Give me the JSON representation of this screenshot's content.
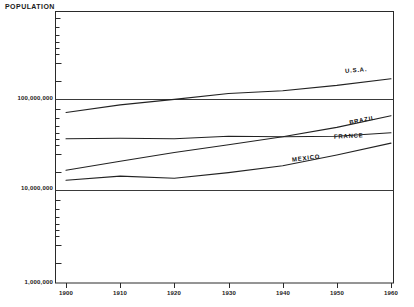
{
  "chart_data": {
    "type": "line",
    "title": "",
    "ylabel": "POPULATION",
    "xlabel": "",
    "yscale": "log",
    "ylim": [
      1000000,
      1000000000
    ],
    "xlim": [
      1900,
      1960
    ],
    "grid": "major-horizontal",
    "legend_position": "inline-right",
    "x_ticks": [
      "1900",
      "1910",
      "1920",
      "1930",
      "1940",
      "1950",
      "1960"
    ],
    "y_ticks": [
      "1,000,000",
      "10,000,000",
      "100,000,000"
    ],
    "x": [
      1900,
      1910,
      1920,
      1930,
      1940,
      1950,
      1960
    ],
    "series": [
      {
        "name": "U.S.A.",
        "values": [
          76000000,
          92000000,
          106000000,
          123000000,
          132000000,
          151000000,
          179000000
        ]
      },
      {
        "name": "BRAZIL",
        "values": [
          17500000,
          22000000,
          27500000,
          33500000,
          41000000,
          52000000,
          70000000
        ]
      },
      {
        "name": "FRANCE",
        "values": [
          39000000,
          39500000,
          39000000,
          41500000,
          41000000,
          41500000,
          45500000
        ]
      },
      {
        "name": "MEXICO",
        "values": [
          13600000,
          15100000,
          14300000,
          16500000,
          19600000,
          25800000,
          34900000
        ]
      }
    ]
  },
  "axis": {
    "y_title": "POPULATION"
  },
  "labels": {
    "usa": "U.S.A.",
    "brazil": "BRAZIL",
    "france": "FRANCE",
    "mexico": "MEXICO",
    "y0": "1,000,000",
    "y1": "10,000,000",
    "y2": "100,000,000",
    "x1900": "1900",
    "x1910": "1910",
    "x1920": "1920",
    "x1930": "1930",
    "x1940": "1940",
    "x1950": "1950",
    "x1960": "1960"
  },
  "colors": {
    "ink": "#1a1a1a",
    "line": "#2a2a2a",
    "background": "#ffffff"
  }
}
